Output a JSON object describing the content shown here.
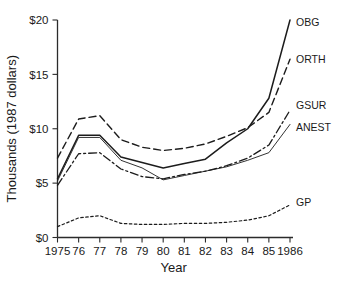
{
  "chart_data": {
    "type": "line",
    "title": "",
    "xlabel": "Year",
    "ylabel": "Thousands (1987 dollars)",
    "x": [
      1975,
      1976,
      1977,
      1978,
      1979,
      1980,
      1981,
      1982,
      1983,
      1984,
      1985,
      1986
    ],
    "xtick_labels": [
      "1975",
      "76",
      "77",
      "78",
      "79",
      "80",
      "81",
      "82",
      "83",
      "84",
      "85",
      "1986"
    ],
    "ytick_labels": [
      "$0",
      "$5",
      "$10",
      "$15",
      "$20"
    ],
    "ytick_values": [
      0,
      5,
      10,
      15,
      20
    ],
    "xlim": [
      1975,
      1986
    ],
    "ylim": [
      0,
      20
    ],
    "grid": false,
    "legend_position": "right-inline-labels",
    "series": [
      {
        "name": "OBG",
        "label": "OBG",
        "style": "solid",
        "color": "#1c1c1c",
        "values": [
          5.4,
          9.4,
          9.4,
          7.4,
          6.9,
          6.4,
          6.8,
          7.2,
          8.7,
          10.0,
          12.8,
          20.0
        ]
      },
      {
        "name": "ORTH",
        "label": "ORTH",
        "style": "dashed",
        "color": "#1c1c1c",
        "values": [
          7.3,
          10.9,
          11.2,
          9.0,
          8.3,
          8.0,
          8.2,
          8.6,
          9.3,
          10.1,
          11.5,
          16.4
        ]
      },
      {
        "name": "GSUR",
        "label": "GSUR",
        "style": "dash-dot",
        "color": "#1c1c1c",
        "values": [
          4.8,
          7.7,
          7.8,
          6.3,
          5.6,
          5.4,
          5.8,
          6.1,
          6.6,
          7.3,
          8.5,
          11.7
        ]
      },
      {
        "name": "ANEST",
        "label": "ANEST",
        "style": "thin-solid",
        "color": "#6f6f6f",
        "values": [
          5.2,
          9.2,
          9.2,
          7.1,
          6.4,
          5.3,
          5.7,
          6.1,
          6.5,
          7.1,
          7.8,
          10.4
        ]
      },
      {
        "name": "GP",
        "label": "GP",
        "style": "dotted",
        "color": "#3a3a3a",
        "values": [
          1.0,
          1.8,
          2.0,
          1.3,
          1.2,
          1.2,
          1.3,
          1.3,
          1.4,
          1.6,
          2.0,
          3.0
        ]
      }
    ]
  }
}
